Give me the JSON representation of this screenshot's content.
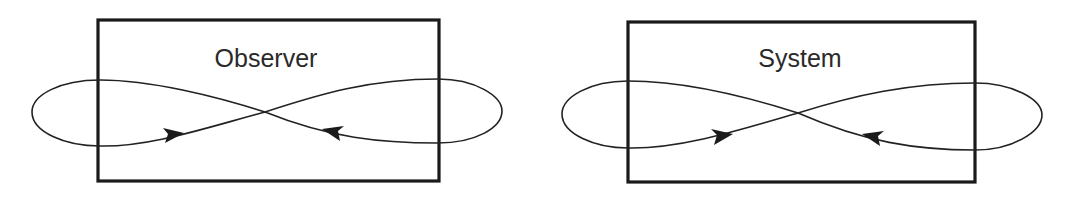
{
  "diagrams": [
    {
      "label": "Observer",
      "box": {
        "x": 98,
        "y": 20,
        "w": 341,
        "h": 161
      },
      "label_pos": {
        "x": 266,
        "y": 67
      },
      "crossing": {
        "x": 265,
        "y": 112
      },
      "arrows": [
        "right-pointing on lower-left branch",
        "left-pointing on lower-right branch"
      ]
    },
    {
      "label": "System",
      "box": {
        "x": 628,
        "y": 22,
        "w": 347,
        "h": 160
      },
      "label_pos": {
        "x": 800,
        "y": 67
      },
      "crossing": {
        "x": 798,
        "y": 113
      },
      "arrows": [
        "right-pointing on lower-left branch",
        "left-pointing on lower-right branch"
      ]
    }
  ],
  "style": {
    "stroke_color": "#1a1a1a",
    "background": "#ffffff"
  }
}
